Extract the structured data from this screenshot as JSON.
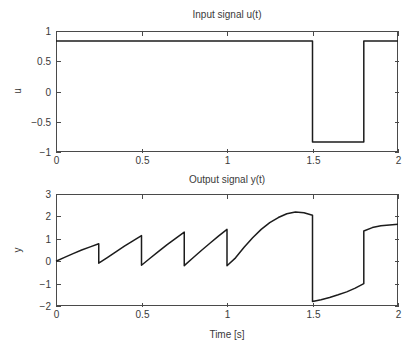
{
  "figure": {
    "background_color": "#ffffff",
    "axis_color": "#4a4a4a",
    "line_color": "#1c1c1c",
    "text_color": "#3a3a3a"
  },
  "panels": {
    "top": {
      "title": "Input signal u(t)",
      "ylabel": "u",
      "xlabel": "",
      "x_ticks": [
        "0",
        "0.5",
        "1",
        "1.5",
        "2"
      ],
      "y_ticks": [
        "1",
        "0.5",
        "0",
        "-0.5",
        "-1"
      ]
    },
    "bottom": {
      "title": "Output signal y(t)",
      "ylabel": "y",
      "xlabel": "Time [s]",
      "x_ticks": [
        "0",
        "0.5",
        "1",
        "1.5",
        "2"
      ],
      "y_ticks": [
        "3",
        "2",
        "1",
        "0",
        "-1",
        "-2"
      ]
    }
  },
  "chart_data": [
    {
      "type": "line",
      "title": "Input signal u(t)",
      "xlabel": "",
      "ylabel": "u",
      "xlim": [
        0,
        2
      ],
      "ylim": [
        -1,
        1
      ],
      "xticks": [
        0,
        0.5,
        1,
        1.5,
        2
      ],
      "yticks": [
        -1,
        -0.5,
        0,
        0.5,
        1
      ],
      "grid": false,
      "legend": null,
      "series": [
        {
          "name": "u(t)",
          "description": "Square wave: high level 0.835 for 0<=t<1.5, low level -0.835 for 1.5<=t<1.8, high level 0.835 for 1.8<=t<=2",
          "x": [
            0,
            1.5,
            1.5,
            1.8,
            1.8,
            2
          ],
          "y": [
            0.835,
            0.835,
            -0.835,
            -0.835,
            0.835,
            0.835
          ]
        }
      ]
    },
    {
      "type": "line",
      "title": "Output signal y(t)",
      "xlabel": "Time [s]",
      "ylabel": "y",
      "xlim": [
        0,
        2
      ],
      "ylim": [
        -2,
        3
      ],
      "xticks": [
        0,
        0.5,
        1,
        1.5,
        2
      ],
      "yticks": [
        -2,
        -1,
        0,
        1,
        2,
        3
      ],
      "grid": false,
      "legend": null,
      "series": [
        {
          "name": "y(t)",
          "description": "Sawtooth-like response with four resets at t=0.25,0.5,0.75,1.0, a smooth rise peaking near 2.2 at t=1.4, a vertical drop at t=1.5 to -1.8, recovery to -1.0 at t=1.8, a jump to 1.35 and settling near 1.65 at t=2",
          "x": [
            0,
            0.05,
            0.1,
            0.15,
            0.2,
            0.25,
            0.25,
            0.3,
            0.35,
            0.4,
            0.45,
            0.5,
            0.5,
            0.55,
            0.6,
            0.65,
            0.7,
            0.75,
            0.75,
            0.8,
            0.85,
            0.9,
            0.95,
            1.0,
            1.0,
            1.05,
            1.1,
            1.15,
            1.2,
            1.25,
            1.3,
            1.35,
            1.4,
            1.45,
            1.5,
            1.5,
            1.55,
            1.6,
            1.65,
            1.7,
            1.75,
            1.8,
            1.8,
            1.85,
            1.9,
            1.95,
            2.0
          ],
          "y": [
            0.0,
            0.17,
            0.34,
            0.5,
            0.64,
            0.78,
            -0.09,
            0.16,
            0.42,
            0.67,
            0.91,
            1.14,
            -0.18,
            0.13,
            0.44,
            0.74,
            1.02,
            1.3,
            -0.2,
            0.14,
            0.48,
            0.8,
            1.12,
            1.42,
            -0.2,
            0.15,
            0.62,
            1.05,
            1.42,
            1.72,
            1.95,
            2.12,
            2.2,
            2.16,
            2.05,
            -1.8,
            -1.72,
            -1.62,
            -1.5,
            -1.37,
            -1.2,
            -1.0,
            1.35,
            1.5,
            1.58,
            1.62,
            1.65
          ]
        }
      ]
    }
  ]
}
